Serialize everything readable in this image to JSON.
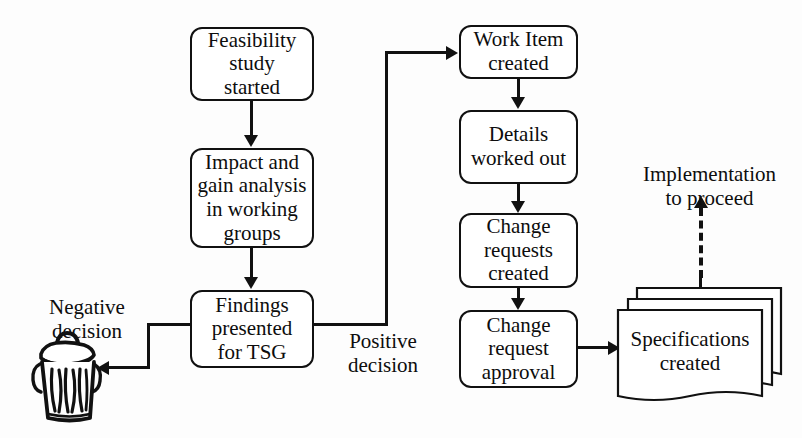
{
  "diagram": {
    "background_color": "#fdfdfd",
    "line_color": "#111111",
    "text_color": "#0d0d0d"
  },
  "nodes": {
    "feasibility": {
      "line1": "Feasibility",
      "line2": "study",
      "line3": "started"
    },
    "impact": {
      "line1": "Impact and",
      "line2": "gain analysis",
      "line3": "in working",
      "line4": "groups"
    },
    "findings": {
      "line1": "Findings",
      "line2": "presented",
      "line3": "for TSG"
    },
    "work_item": {
      "line1": "Work Item",
      "line2": "created"
    },
    "details": {
      "line1": "Details",
      "line2": "worked out"
    },
    "change_requests": {
      "line1": "Change",
      "line2": "requests",
      "line3": "created"
    },
    "change_approval": {
      "line1": "Change",
      "line2": "request",
      "line3": "approval"
    },
    "specifications": {
      "line1": "Specifications",
      "line2": "created"
    }
  },
  "labels": {
    "negative_decision": "Negative\ndecision",
    "positive_decision": "Positive\ndecision",
    "implementation": "Implementation\nto proceed"
  },
  "icons": {
    "trash_can": "trash-can-icon"
  },
  "edges": [
    {
      "from": "feasibility",
      "to": "impact",
      "style": "solid",
      "arrow": "down"
    },
    {
      "from": "impact",
      "to": "findings",
      "style": "solid",
      "arrow": "down"
    },
    {
      "from": "findings",
      "to": "trash_can",
      "style": "solid",
      "arrow": "left",
      "label": "Negative decision"
    },
    {
      "from": "findings",
      "to": "work_item",
      "style": "solid",
      "arrow": "right",
      "label": "Positive decision"
    },
    {
      "from": "work_item",
      "to": "details",
      "style": "solid",
      "arrow": "down"
    },
    {
      "from": "details",
      "to": "change_requests",
      "style": "solid",
      "arrow": "down"
    },
    {
      "from": "change_requests",
      "to": "change_approval",
      "style": "solid",
      "arrow": "down"
    },
    {
      "from": "change_approval",
      "to": "specifications",
      "style": "solid",
      "arrow": "right"
    },
    {
      "from": "specifications",
      "to": "implementation",
      "style": "dashed",
      "arrow": "up"
    }
  ]
}
